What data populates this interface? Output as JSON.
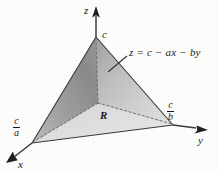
{
  "figure": {
    "background_color": "#fdfdfc"
  },
  "axes": {
    "z": {
      "label": "z",
      "tick_label": "c"
    },
    "x": {
      "label": "x",
      "tick_numerator": "c",
      "tick_denominator": "a"
    },
    "y": {
      "label": "y",
      "tick_numerator": "c",
      "tick_denominator": "b"
    }
  },
  "annotations": {
    "surface_equation": "z = c − ax − by",
    "region_label": "R"
  },
  "colors": {
    "left_face_dark": "#8c8c8c",
    "left_face_light": "#c9c9c9",
    "right_face_dark": "#a8a8a8",
    "right_face_light": "#dcdcdc",
    "base_face": "#d4d4d4",
    "line": "#2b2b2b",
    "dashed_line": "#6e6e6e",
    "text": "#1a1a1a"
  },
  "geometry": {
    "apex": [
      96,
      37
    ],
    "origin": [
      98,
      103
    ],
    "x_vertex": [
      32,
      143
    ],
    "y_vertex": [
      173,
      125
    ]
  }
}
